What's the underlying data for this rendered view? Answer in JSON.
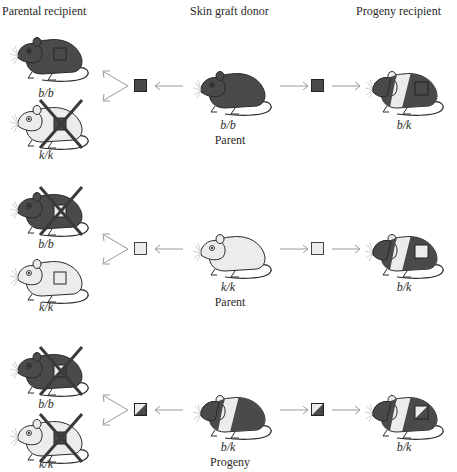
{
  "headers": {
    "parental_recipient": "Parental recipient",
    "skin_graft_donor": "Skin graft donor",
    "progeny_recipient": "Progeny recipient"
  },
  "colors": {
    "dark_fur": "#4a4a4a",
    "light_fur": "#ececec",
    "outline": "#2a2a2a",
    "arrow": "#9a9a9a",
    "reject_x": "#3a3a3a"
  },
  "rows": [
    {
      "donor": {
        "genotype": "b/b",
        "role": "Parent",
        "coat": "dark"
      },
      "graft": "dark",
      "recipients": [
        {
          "genotype": "b/b",
          "coat": "dark",
          "rejected": false
        },
        {
          "genotype": "k/k",
          "coat": "light",
          "rejected": true
        }
      ],
      "progeny_recipient": {
        "genotype": "b/k",
        "coat": "banded",
        "rejected": false
      }
    },
    {
      "donor": {
        "genotype": "k/k",
        "role": "Parent",
        "coat": "light"
      },
      "graft": "light",
      "recipients": [
        {
          "genotype": "b/b",
          "coat": "dark",
          "rejected": true
        },
        {
          "genotype": "k/k",
          "coat": "light",
          "rejected": false
        }
      ],
      "progeny_recipient": {
        "genotype": "b/k",
        "coat": "banded",
        "rejected": false
      }
    },
    {
      "donor": {
        "genotype": "b/k",
        "role": "Progeny",
        "coat": "banded"
      },
      "graft": "split",
      "recipients": [
        {
          "genotype": "b/b",
          "coat": "dark",
          "rejected": true
        },
        {
          "genotype": "k/k",
          "coat": "light",
          "rejected": true
        }
      ],
      "progeny_recipient": {
        "genotype": "b/k",
        "coat": "banded",
        "rejected": false
      }
    }
  ]
}
